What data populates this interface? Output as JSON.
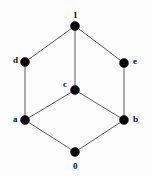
{
  "figure": {
    "kind": "hasse-diagram",
    "width": 152,
    "height": 176,
    "background_color": "#fdfdfd",
    "node_color": "#080808",
    "edge_color": "#5a5a5a"
  },
  "chart_data": {
    "type": "diagram",
    "title": "",
    "xlabel": "",
    "ylabel": "",
    "nodes": [
      {
        "id": "top",
        "label": "1",
        "x": 75,
        "y": 26,
        "r": 4.5,
        "label_x": 73,
        "label_y": 11,
        "label_pos": "above"
      },
      {
        "id": "d",
        "label": "d",
        "x": 25,
        "y": 62,
        "r": 4.5,
        "label_x": 13,
        "label_y": 56,
        "label_pos": "left"
      },
      {
        "id": "e",
        "label": "e",
        "x": 124,
        "y": 63,
        "r": 4.5,
        "label_x": 133,
        "label_y": 57,
        "label_pos": "right"
      },
      {
        "id": "c",
        "label": "c",
        "x": 75,
        "y": 90,
        "r": 4.5,
        "label_x": 63,
        "label_y": 80,
        "label_pos": "upper-left"
      },
      {
        "id": "a",
        "label": "a",
        "x": 25,
        "y": 120,
        "r": 4.5,
        "label_x": 13,
        "label_y": 115,
        "label_pos": "left"
      },
      {
        "id": "b",
        "label": "b",
        "x": 124,
        "y": 120,
        "r": 4.5,
        "label_x": 133,
        "label_y": 115,
        "label_pos": "right"
      },
      {
        "id": "bottom",
        "label": "0",
        "x": 75,
        "y": 152,
        "r": 4.5,
        "label_x": 73,
        "label_y": 162,
        "label_pos": "below"
      }
    ],
    "edges": [
      {
        "from": "top",
        "to": "d"
      },
      {
        "from": "top",
        "to": "c"
      },
      {
        "from": "top",
        "to": "e"
      },
      {
        "from": "d",
        "to": "a"
      },
      {
        "from": "e",
        "to": "b"
      },
      {
        "from": "a",
        "to": "c"
      },
      {
        "from": "c",
        "to": "b"
      },
      {
        "from": "a",
        "to": "bottom"
      },
      {
        "from": "bottom",
        "to": "b"
      }
    ]
  }
}
